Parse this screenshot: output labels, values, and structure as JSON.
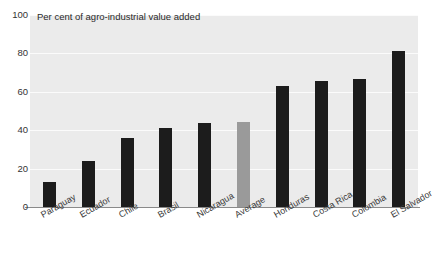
{
  "chart_data": {
    "type": "bar",
    "title": "Per cent of agro-industrial value added",
    "xlabel": "",
    "ylabel": "",
    "ylim": [
      0,
      100
    ],
    "yticks": [
      0,
      20,
      40,
      60,
      80,
      100
    ],
    "grid": true,
    "legend": "none",
    "categories": [
      "Paraguay",
      "Ecuador",
      "Chile",
      "Brasil",
      "Nicaragua",
      "Average",
      "Honduras",
      "Costa Rica",
      "Colombia",
      "El Salvador"
    ],
    "values": [
      13,
      24,
      36,
      41,
      43.5,
      44.5,
      63,
      65.5,
      66.5,
      81.5
    ],
    "bar_colors": [
      "#1c1c1c",
      "#1c1c1c",
      "#1c1c1c",
      "#1c1c1c",
      "#1c1c1c",
      "#9a9a9a",
      "#1c1c1c",
      "#1c1c1c",
      "#1c1c1c",
      "#1c1c1c"
    ],
    "highlight_category": "Average",
    "plot_background": "#ebebeb",
    "gridline_color": "#fbfbfb",
    "axis_color": "#8a8a8a"
  }
}
